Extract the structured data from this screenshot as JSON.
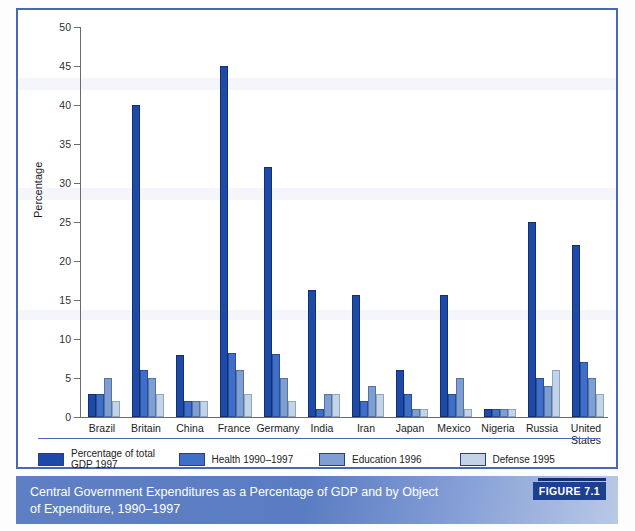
{
  "figure": {
    "caption": "Central Government Expenditures as a Percentage of GDP and by Object of Expenditure, 1990–1997",
    "figure_tag": "FIGURE 7.1"
  },
  "legend": {
    "items": [
      {
        "label": "Percentage of total GDP 1997",
        "color": "#1d4aa8"
      },
      {
        "label": "Health 1990–1997",
        "color": "#3f6fc8"
      },
      {
        "label": "Education 1996",
        "color": "#7e9ed4"
      },
      {
        "label": "Defense 1995",
        "color": "#c3d3e8"
      }
    ]
  },
  "axis": {
    "y_title": "Percentage",
    "y_ticks": [
      "0",
      "5",
      "10",
      "15",
      "20",
      "25",
      "30",
      "35",
      "40",
      "45",
      "50"
    ]
  },
  "chart_data": {
    "type": "bar",
    "title": "Central Government Expenditures as a Percentage of GDP and by Object of Expenditure, 1990–1997",
    "xlabel": "",
    "ylabel": "Percentage",
    "ylim": [
      0,
      50
    ],
    "ytick_step": 5,
    "grid": false,
    "legend_position": "below-axis",
    "categories": [
      "Brazil",
      "Britain",
      "China",
      "France",
      "Germany",
      "India",
      "Iran",
      "Japan",
      "Mexico",
      "Nigeria",
      "Russia",
      "United States"
    ],
    "series": [
      {
        "name": "Percentage of total GDP 1997",
        "color": "#1d4aa8",
        "values": [
          3,
          40,
          8,
          45,
          32,
          16.3,
          15.7,
          6,
          15.7,
          1,
          25,
          22
        ]
      },
      {
        "name": "Health 1990–1997",
        "color": "#3f6fc8",
        "values": [
          3,
          6,
          2,
          8.2,
          8.1,
          1,
          2,
          3,
          3,
          1,
          5,
          7
        ]
      },
      {
        "name": "Education 1996",
        "color": "#7e9ed4",
        "values": [
          5,
          5,
          2,
          6,
          5,
          3,
          4,
          1,
          5,
          1,
          4,
          5
        ]
      },
      {
        "name": "Defense 1995",
        "color": "#c3d3e8",
        "values": [
          2,
          3,
          2,
          3,
          2,
          3,
          3,
          1,
          1,
          1,
          6,
          3
        ]
      }
    ]
  }
}
